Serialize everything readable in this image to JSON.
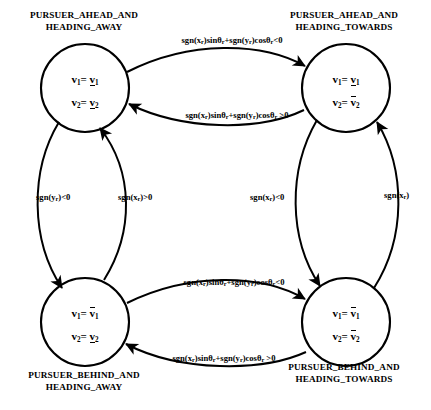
{
  "diagram": {
    "type": "state-transition-diagram",
    "states": [
      {
        "id": "pursuer-ahead-and-heading-away",
        "caption": "PURSUER_AHEAD_AND\nHEADING_AWAY",
        "v1_var": "v",
        "v1_sub": "1",
        "v1_value_sym": "v",
        "v1_value_sub": "1",
        "v1_value_bar": "under",
        "v2_var": "v",
        "v2_sub": "2",
        "v2_value_sym": "v",
        "v2_value_sub": "2",
        "v2_value_bar": "under",
        "position": "top-left"
      },
      {
        "id": "pursuer-ahead-and-heading-towards",
        "caption": "PURSUER_AHEAD_AND\nHEADING_TOWARDS",
        "v1_var": "v",
        "v1_sub": "1",
        "v1_value_sym": "v",
        "v1_value_sub": "1",
        "v1_value_bar": "under",
        "v2_var": "v",
        "v2_sub": "2",
        "v2_value_sym": "v",
        "v2_value_sub": "2",
        "v2_value_bar": "over",
        "position": "top-right"
      },
      {
        "id": "pursuer-behind-and-heading-away",
        "caption": "PURSUER_BEHIND_AND\nHEADING_AWAY",
        "v1_var": "v",
        "v1_sub": "1",
        "v1_value_sym": "v",
        "v1_value_sub": "1",
        "v1_value_bar": "over",
        "v2_var": "v",
        "v2_sub": "2",
        "v2_value_sym": "v",
        "v2_value_sub": "2",
        "v2_value_bar": "under",
        "position": "bottom-left"
      },
      {
        "id": "pursuer-behind-and-heading-towards",
        "caption": "PURSUER_BEHIND_AND\nHEADING_TOWARDS",
        "v1_var": "v",
        "v1_sub": "1",
        "v1_value_sym": "v",
        "v1_value_sub": "1",
        "v1_value_bar": "over",
        "v2_var": "v",
        "v2_sub": "2",
        "v2_value_sym": "v",
        "v2_value_sub": "2",
        "v2_value_bar": "over",
        "position": "bottom-right"
      }
    ],
    "transitions": [
      {
        "id": "top-forward",
        "from": "pursuer-ahead-and-heading-away",
        "to": "pursuer-ahead-and-heading-towards",
        "guard_parts": [
          "sgn(x",
          "r",
          ")sin",
          "θ",
          "r",
          "+sgn(y",
          "r",
          ")cos",
          "θ",
          "r",
          "<0"
        ],
        "guard_plain": "sgn(x_r)sinθ_r+sgn(y_r)cosθ_r<0"
      },
      {
        "id": "top-back",
        "from": "pursuer-ahead-and-heading-towards",
        "to": "pursuer-ahead-and-heading-away",
        "guard_plain": "sgn(x_r)sinθ_r+sgn(y_r)cosθ_r >0"
      },
      {
        "id": "left-down",
        "from": "pursuer-ahead-and-heading-away",
        "to": "pursuer-behind-and-heading-away",
        "guard_plain": "sgn(y_r)<0"
      },
      {
        "id": "left-up",
        "from": "pursuer-behind-and-heading-away",
        "to": "pursuer-ahead-and-heading-away",
        "guard_plain": "sgn(y_r)>0"
      },
      {
        "id": "right-down",
        "from": "pursuer-ahead-and-heading-towards",
        "to": "pursuer-behind-and-heading-towards",
        "guard_plain": "sgn(y_r)<0"
      },
      {
        "id": "right-up",
        "from": "pursuer-behind-and-heading-towards",
        "to": "pursuer-ahead-and-heading-towards",
        "guard_plain": "sgn(y_r)"
      },
      {
        "id": "bottom-forward",
        "from": "pursuer-behind-and-heading-away",
        "to": "pursuer-behind-and-heading-towards",
        "guard_plain": "sgn(x_r)sinθ_r+sgn(y_r)cosθ_r<0"
      },
      {
        "id": "bottom-back",
        "from": "pursuer-behind-and-heading-towards",
        "to": "pursuer-behind-and-heading-away",
        "guard_plain": "sgn(x_r)sinθ_r+sgn(y_r)cosθ_r >0"
      }
    ],
    "labels": {
      "top_forward": {
        "p1": "sgn(x",
        "s1": "r",
        "p2": ")sin",
        "th1": "θ",
        "s2": "r",
        "p3": "+sgn(y",
        "s3": "r",
        "p4": ")cos",
        "th2": "θ",
        "s4": "r",
        "p5": "<0"
      },
      "top_back": {
        "p1": "sgn(x",
        "s1": "r",
        "p2": ")sin",
        "th1": "θ",
        "s2": "r",
        "p3": "+sgn(y",
        "s3": "r",
        "p4": ")cos",
        "th2": "θ",
        "s4": "r",
        "p5": " >0"
      },
      "bottom_forward": {
        "p1": "sgn(x",
        "s1": "r",
        "p2": ")sin",
        "th1": "θ",
        "s2": "r",
        "p3": "+sgn(y",
        "s3": "r",
        "p4": ")cos",
        "th2": "θ",
        "s4": "r",
        "p5": "<0"
      },
      "bottom_back": {
        "p1": "sgn(x",
        "s1": "r",
        "p2": ")sin",
        "th1": "θ",
        "s2": "r",
        "p3": "+sgn(y",
        "s3": "r",
        "p4": ")cos",
        "th2": "θ",
        "s4": "r",
        "p5": " >0"
      },
      "left_outer": {
        "p1": "sgn(y",
        "s1": "r",
        "p2": ")<0"
      },
      "left_inner": {
        "p1": "sgn(x",
        "s1": "r",
        "p2": ")>0"
      },
      "right_inner": {
        "p1": "sgn(x",
        "s1": "r",
        "p2": ")<0"
      },
      "right_outer": {
        "p1": "sgn(x",
        "s1": "r",
        "p2": ")"
      }
    },
    "style": {
      "stroke": "#000000",
      "background": "#ffffff",
      "node_radius": 44
    }
  }
}
